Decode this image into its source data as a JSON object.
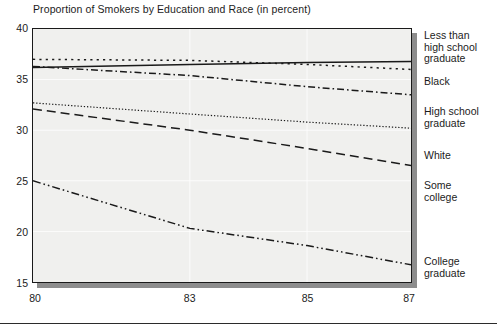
{
  "chart_data": {
    "type": "line",
    "title": "Proportion of Smokers by Education and Race (in percent)",
    "xlabel": "",
    "ylabel": "",
    "x": [
      80,
      83,
      85,
      87
    ],
    "x_tick_labels": [
      "80",
      "83",
      "85",
      "87"
    ],
    "y_tick_labels": [
      "15",
      "20",
      "25",
      "30",
      "35",
      "40"
    ],
    "y_ticks": [
      15,
      20,
      25,
      30,
      35,
      40
    ],
    "ylim": [
      15,
      40
    ],
    "xlim": [
      80,
      87
    ],
    "grid": true,
    "legend_position": "right-margin-inline",
    "series": [
      {
        "name": "Less than high school graduate",
        "label": "Less than high school graduate",
        "line_style": "solid",
        "values": [
          36.2,
          36.5,
          36.7,
          36.8
        ]
      },
      {
        "name": "Black",
        "label": "Black",
        "line_style": "dotted-coarse",
        "values": [
          37.0,
          36.9,
          36.5,
          36.0
        ]
      },
      {
        "name": "High school graduate",
        "label": "High school graduate",
        "line_style": "dash-dot",
        "values": [
          36.3,
          35.4,
          34.3,
          33.5
        ]
      },
      {
        "name": "White",
        "label": "White",
        "line_style": "dotted-fine",
        "values": [
          32.7,
          31.6,
          30.8,
          30.2
        ]
      },
      {
        "name": "Some college",
        "label": "Some college",
        "line_style": "dashed",
        "values": [
          32.1,
          30.0,
          28.2,
          26.5
        ]
      },
      {
        "name": "College graduate",
        "label": "College graduate",
        "line_style": "dash-dot-dot",
        "values": [
          25.0,
          20.3,
          18.6,
          16.7
        ]
      }
    ]
  },
  "series_label_layout": [
    {
      "top": 2,
      "lines": [
        "Less than",
        "high school",
        "graduate"
      ]
    },
    {
      "top": 48,
      "lines": [
        "Black"
      ]
    },
    {
      "top": 78,
      "lines": [
        "High school",
        "graduate"
      ]
    },
    {
      "top": 122,
      "lines": [
        "White"
      ]
    },
    {
      "top": 152,
      "lines": [
        "Some",
        "college"
      ]
    },
    {
      "top": 228,
      "lines": [
        "College",
        "graduate"
      ]
    }
  ],
  "colors": {
    "ink": "#1a1a1a",
    "plot_background": "#f0f0ee",
    "shadow": "#8d8d8d",
    "gridline": "#ffffff"
  }
}
